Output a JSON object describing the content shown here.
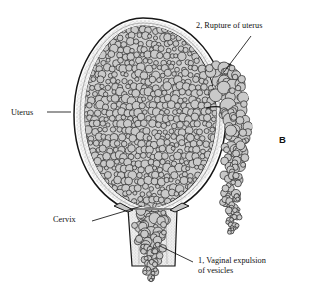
{
  "figure": {
    "panel_label": "B",
    "title_alt": "Hydatidiform mole with uterine rupture and vaginal expulsion of vesicles",
    "background_color": "#ffffff",
    "ink_color": "#111111",
    "vesicle_fill": "#c9c9c9",
    "vesicle_stroke": "#2b2b2b",
    "wall_stipple": "#b8b8b8",
    "wall_fill": "#f2f2f2"
  },
  "labels": [
    {
      "id": "rupture",
      "text": "2, Rupture of uterus",
      "x": 196,
      "y": 21
    },
    {
      "id": "uterus",
      "text": "Uterus",
      "x": 11,
      "y": 108
    },
    {
      "id": "cervix",
      "text": "Cervix",
      "x": 53,
      "y": 215
    },
    {
      "id": "panel",
      "text": "B",
      "x": 279,
      "y": 135
    }
  ],
  "labels_multiline": [
    {
      "id": "expulsion",
      "line1": "1, Vaginal expulsion",
      "line2": "of vesicles",
      "x": 198,
      "y": 256
    }
  ],
  "leaders": [
    {
      "id": "leader-rupture",
      "x1": 251,
      "y1": 36,
      "x2": 224,
      "y2": 72
    },
    {
      "id": "leader-uterus",
      "x1": 47,
      "y1": 112,
      "x2": 71,
      "y2": 112
    },
    {
      "id": "leader-cervix",
      "x1": 92,
      "y1": 221,
      "x2": 142,
      "y2": 206
    },
    {
      "id": "leader-expulsion",
      "x1": 193,
      "y1": 262,
      "x2": 160,
      "y2": 246
    }
  ],
  "anatomy": {
    "uterus_outer": "pear-shaped uterine body, double-contour wall",
    "myometrium": "stippled wall band between inner and outer contours",
    "cavity_contents": "mass of grape-like molar vesicles filling cavity",
    "rupture_site": "defect in right uterine wall with vesicles herniating through",
    "escaping_cluster": "column of vesicles hanging from rupture site",
    "cervix": "narrow canal below uterine body",
    "vagina": "tubular canal with vesicles passing through",
    "expelled_vesicles": "vesicles dropping free below vaginal orifice"
  }
}
